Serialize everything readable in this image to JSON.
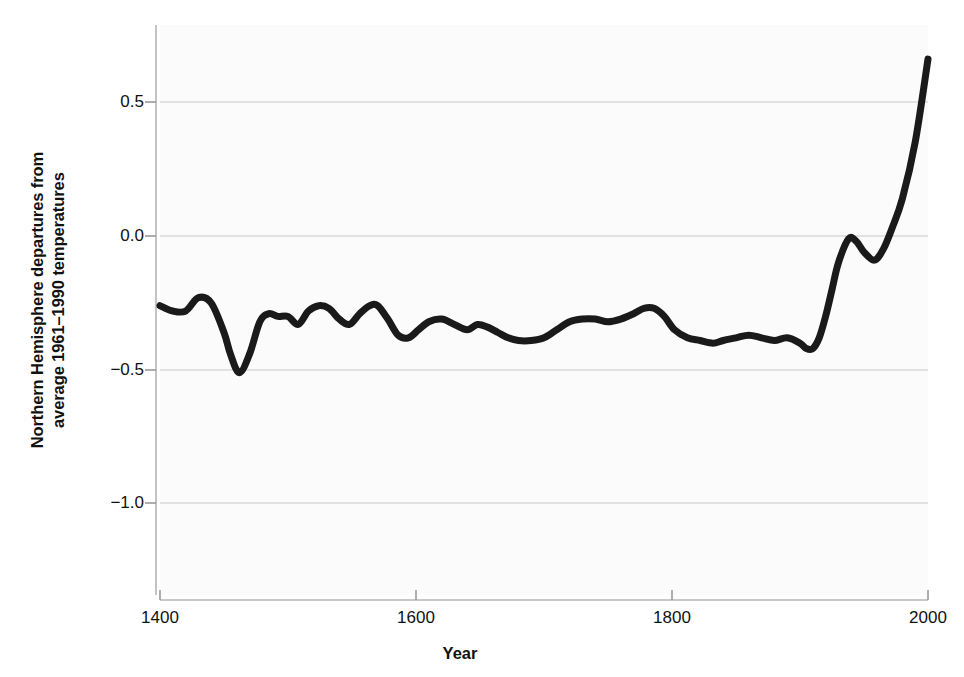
{
  "chart_data": {
    "type": "line",
    "title": "",
    "subtitle": "",
    "xlabel": "Year",
    "ylabel": "Northern Hemisphere departures from average 1961–1990 temperatures",
    "ylabel_line1": "Northern Hemisphere departures from",
    "ylabel_line2": "average 1961–1990 temperatures",
    "xlim": [
      1400,
      2000
    ],
    "ylim": [
      -1.28,
      0.78
    ],
    "xticks": [
      1400,
      1600,
      1800,
      2000
    ],
    "xtick_labels": [
      "1400",
      "1600",
      "1800",
      "2000"
    ],
    "yticks": [
      0.5,
      0.0,
      -0.5,
      -1.0
    ],
    "ytick_labels": [
      "0.5",
      "0.0",
      "−0.5",
      "−1.0"
    ],
    "grid": "horizontal",
    "grid_color": "#c9c9c9",
    "line_color": "#1a1a1a",
    "line_width": 7,
    "plot_background": "#fbfbfb",
    "legend": "none",
    "series": [
      {
        "name": "Northern Hemisphere temperature anomaly",
        "x": [
          1400,
          1410,
          1420,
          1430,
          1440,
          1450,
          1455,
          1462,
          1470,
          1478,
          1485,
          1492,
          1500,
          1508,
          1516,
          1524,
          1532,
          1540,
          1548,
          1556,
          1564,
          1570,
          1578,
          1586,
          1594,
          1602,
          1610,
          1620,
          1630,
          1640,
          1648,
          1656,
          1664,
          1672,
          1680,
          1690,
          1700,
          1710,
          1720,
          1730,
          1740,
          1750,
          1760,
          1770,
          1778,
          1786,
          1794,
          1802,
          1812,
          1822,
          1832,
          1840,
          1850,
          1860,
          1870,
          1880,
          1890,
          1900,
          1905,
          1910,
          1915,
          1920,
          1925,
          1930,
          1938,
          1944,
          1950,
          1958,
          1965,
          1972,
          1980,
          1990,
          2000
        ],
        "y": [
          -0.26,
          -0.28,
          -0.28,
          -0.23,
          -0.25,
          -0.36,
          -0.44,
          -0.51,
          -0.44,
          -0.32,
          -0.29,
          -0.3,
          -0.3,
          -0.33,
          -0.28,
          -0.26,
          -0.27,
          -0.31,
          -0.33,
          -0.29,
          -0.26,
          -0.26,
          -0.31,
          -0.37,
          -0.38,
          -0.35,
          -0.32,
          -0.31,
          -0.33,
          -0.35,
          -0.33,
          -0.34,
          -0.36,
          -0.38,
          -0.39,
          -0.39,
          -0.38,
          -0.35,
          -0.32,
          -0.31,
          -0.31,
          -0.32,
          -0.31,
          -0.29,
          -0.27,
          -0.27,
          -0.3,
          -0.35,
          -0.38,
          -0.39,
          -0.4,
          -0.39,
          -0.38,
          -0.37,
          -0.38,
          -0.39,
          -0.38,
          -0.4,
          -0.42,
          -0.42,
          -0.38,
          -0.3,
          -0.2,
          -0.1,
          -0.01,
          -0.02,
          -0.06,
          -0.09,
          -0.05,
          0.03,
          0.14,
          0.35,
          0.66
        ],
        "description": "Temperature anomaly in degrees Celsius relative to the 1961–1990 average"
      }
    ],
    "annotations": []
  },
  "figure": {
    "axis_color": "#b0b0b0",
    "text_color": "#111111"
  }
}
